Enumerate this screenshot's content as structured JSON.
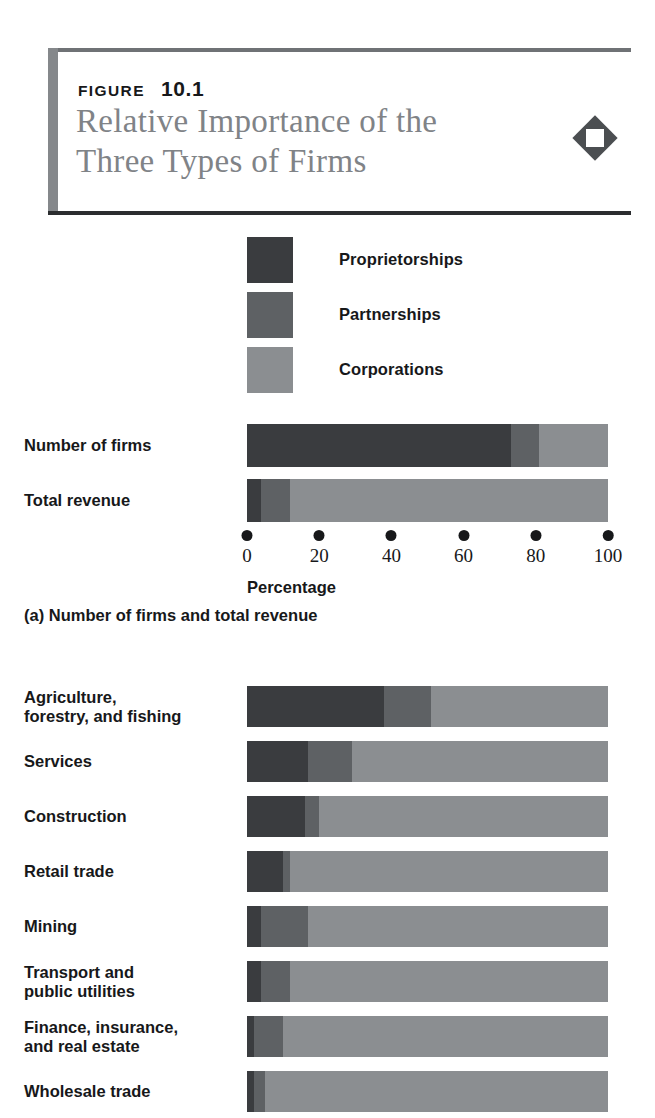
{
  "header": {
    "kicker": "FIGURE",
    "number": "10.1",
    "title_line1": "Relative Importance of the",
    "title_line2": "Three Types of Firms",
    "icon": "diamond-icon"
  },
  "legend": {
    "items": [
      {
        "label": "Proprietorships",
        "color": "#3a3c3f"
      },
      {
        "label": "Partnerships",
        "color": "#5e6164"
      },
      {
        "label": "Corporations",
        "color": "#8b8e91"
      }
    ]
  },
  "panel_a": {
    "caption": "(a) Number of firms and total revenue",
    "axis_title": "Percentage"
  },
  "panel_b": {
    "caption": ""
  },
  "chart_data": [
    {
      "type": "bar",
      "orientation": "horizontal",
      "stacked": true,
      "normalized": true,
      "title": "(a) Number of firms and total revenue",
      "xlabel": "Percentage",
      "ylabel": "",
      "xlim": [
        0,
        100
      ],
      "ticks": [
        0,
        20,
        40,
        60,
        80,
        100
      ],
      "tick_labels": [
        "0",
        "20",
        "40",
        "60",
        "80",
        "100"
      ],
      "grid": false,
      "legend": [
        "Proprietorships",
        "Partnerships",
        "Corporations"
      ],
      "legend_position": "above-plot",
      "categories": [
        "Number of firms",
        "Total revenue"
      ],
      "series": [
        {
          "name": "Proprietorships",
          "color": "#3a3c3f",
          "values": [
            73,
            4
          ]
        },
        {
          "name": "Partnerships",
          "color": "#5e6164",
          "values": [
            8,
            8
          ]
        },
        {
          "name": "Corporations",
          "color": "#8b8e91",
          "values": [
            19,
            88
          ]
        }
      ]
    },
    {
      "type": "bar",
      "orientation": "horizontal",
      "stacked": true,
      "normalized": true,
      "title": "",
      "xlabel": "",
      "ylabel": "",
      "xlim": [
        0,
        100
      ],
      "grid": false,
      "legend": [
        "Proprietorships",
        "Partnerships",
        "Corporations"
      ],
      "categories": [
        "Agriculture,\nforestry, and fishing",
        "Services",
        "Construction",
        "Retail trade",
        "Mining",
        "Transport and\npublic utilities",
        "Finance, insurance,\nand real estate",
        "Wholesale trade"
      ],
      "category_lines": [
        [
          "Agriculture,",
          "forestry, and fishing"
        ],
        [
          "Services"
        ],
        [
          "Construction"
        ],
        [
          "Retail trade"
        ],
        [
          "Mining"
        ],
        [
          "Transport and",
          "public utilities"
        ],
        [
          "Finance, insurance,",
          "and real estate"
        ],
        [
          "Wholesale trade"
        ]
      ],
      "series": [
        {
          "name": "Proprietorships",
          "color": "#3a3c3f",
          "values": [
            38,
            17,
            16,
            10,
            4,
            4,
            2,
            2
          ]
        },
        {
          "name": "Partnerships",
          "color": "#5e6164",
          "values": [
            13,
            12,
            4,
            2,
            13,
            8,
            8,
            3
          ]
        },
        {
          "name": "Corporations",
          "color": "#8b8e91",
          "values": [
            49,
            71,
            80,
            88,
            83,
            88,
            90,
            95
          ]
        }
      ]
    }
  ]
}
